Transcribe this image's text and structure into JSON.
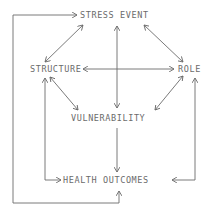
{
  "diagram": {
    "nodes": {
      "stress_event": "STRESS EVENT",
      "structure": "STRUCTURE",
      "role": "ROLE",
      "vulnerability": "VULNERABILITY",
      "health_outcomes": "HEALTH OUTCOMES"
    },
    "edges": [
      {
        "from": "STRESS EVENT",
        "to": "STRUCTURE",
        "type": "bidirectional"
      },
      {
        "from": "STRESS EVENT",
        "to": "ROLE",
        "type": "bidirectional"
      },
      {
        "from": "STRESS EVENT",
        "to": "VULNERABILITY",
        "type": "bidirectional"
      },
      {
        "from": "STRUCTURE",
        "to": "ROLE",
        "type": "bidirectional"
      },
      {
        "from": "STRUCTURE",
        "to": "VULNERABILITY",
        "type": "bidirectional"
      },
      {
        "from": "ROLE",
        "to": "VULNERABILITY",
        "type": "bidirectional"
      },
      {
        "from": "VULNERABILITY",
        "to": "HEALTH OUTCOMES",
        "type": "directed"
      },
      {
        "from": "STRUCTURE",
        "to": "HEALTH OUTCOMES",
        "type": "bidirectional"
      },
      {
        "from": "ROLE",
        "to": "HEALTH OUTCOMES",
        "type": "bidirectional"
      },
      {
        "from": "HEALTH OUTCOMES",
        "to": "STRESS EVENT",
        "type": "bidirectional-loop"
      }
    ],
    "colors": {
      "line": "#6b6b6b",
      "background": "#ffffff"
    }
  }
}
